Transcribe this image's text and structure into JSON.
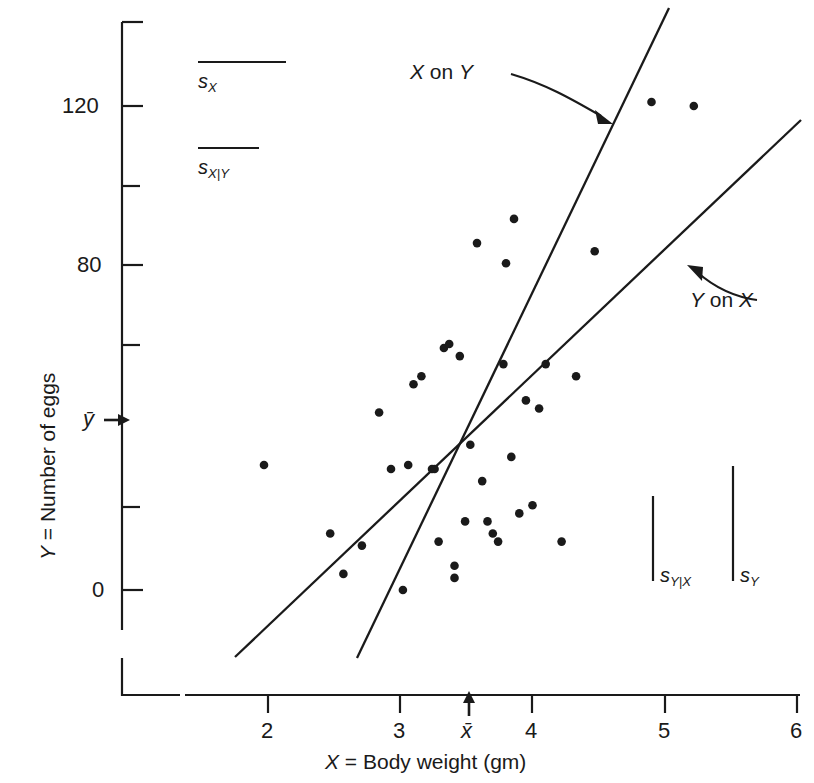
{
  "chart_data": {
    "type": "scatter",
    "title": "",
    "xlabel": "X = Body weight (gm)",
    "ylabel": "Y = Number of eggs",
    "xlim": [
      1.5,
      6.2
    ],
    "ylim": [
      -22,
      138
    ],
    "grid": false,
    "legend_position": "inside",
    "x_ticks": [
      "2",
      "3",
      "4",
      "5",
      "6"
    ],
    "x_tick_values": [
      2,
      3,
      4,
      5,
      6
    ],
    "y_ticks": [
      "0",
      "",
      "",
      "80",
      "",
      "120"
    ],
    "y_tick_values": [
      0,
      20,
      40,
      60,
      80,
      100,
      120
    ],
    "y_labeled_ticks": [
      {
        "value": 120,
        "label": "120"
      },
      {
        "value": 80,
        "label": "80"
      },
      {
        "value": 0,
        "label": "0"
      }
    ],
    "mean_markers": [
      {
        "name": "x-bar",
        "label": "x̄",
        "axis": "x",
        "value": 3.52
      },
      {
        "name": "y-bar",
        "label": "ȳ",
        "axis": "y",
        "value": 44
      }
    ],
    "points": [
      {
        "x": 1.97,
        "y": 31
      },
      {
        "x": 2.47,
        "y": 14
      },
      {
        "x": 2.57,
        "y": 4
      },
      {
        "x": 2.71,
        "y": 11
      },
      {
        "x": 2.84,
        "y": 44
      },
      {
        "x": 2.93,
        "y": 30
      },
      {
        "x": 3.02,
        "y": 0
      },
      {
        "x": 3.06,
        "y": 31
      },
      {
        "x": 3.1,
        "y": 51
      },
      {
        "x": 3.16,
        "y": 53
      },
      {
        "x": 3.24,
        "y": 30
      },
      {
        "x": 3.26,
        "y": 30
      },
      {
        "x": 3.29,
        "y": 12
      },
      {
        "x": 3.33,
        "y": 60
      },
      {
        "x": 3.37,
        "y": 61
      },
      {
        "x": 3.41,
        "y": 6
      },
      {
        "x": 3.41,
        "y": 3
      },
      {
        "x": 3.45,
        "y": 58
      },
      {
        "x": 3.49,
        "y": 17
      },
      {
        "x": 3.53,
        "y": 36
      },
      {
        "x": 3.58,
        "y": 86
      },
      {
        "x": 3.62,
        "y": 27
      },
      {
        "x": 3.66,
        "y": 17
      },
      {
        "x": 3.7,
        "y": 14
      },
      {
        "x": 3.74,
        "y": 12
      },
      {
        "x": 3.78,
        "y": 56
      },
      {
        "x": 3.8,
        "y": 81
      },
      {
        "x": 3.84,
        "y": 33
      },
      {
        "x": 3.86,
        "y": 92
      },
      {
        "x": 3.9,
        "y": 19
      },
      {
        "x": 3.95,
        "y": 47
      },
      {
        "x": 4.0,
        "y": 21
      },
      {
        "x": 4.05,
        "y": 45
      },
      {
        "x": 4.1,
        "y": 56
      },
      {
        "x": 4.22,
        "y": 12
      },
      {
        "x": 4.33,
        "y": 53
      },
      {
        "x": 4.47,
        "y": 84
      },
      {
        "x": 4.9,
        "y": 121
      },
      {
        "x": 5.22,
        "y": 120
      }
    ],
    "lines": [
      {
        "name": "Y on X",
        "label": "Y on X",
        "x_start": 1.88,
        "y_start": -20,
        "x_end": 6.03,
        "y_end": 116
      },
      {
        "name": "X on Y",
        "label": "X on Y",
        "x_start": 2.8,
        "y_start": -20,
        "x_end": 4.53,
        "y_end": 141
      }
    ],
    "annotations": [
      {
        "name": "x-on-y-annotation",
        "label": "X on Y",
        "target_line": "X on Y"
      },
      {
        "name": "y-on-x-annotation",
        "label": "Y on X",
        "target_line": "Y on X"
      }
    ],
    "scale_bars": [
      {
        "name": "s-x",
        "label": "s",
        "sub": "X",
        "orientation": "horizontal",
        "length_units": 0.9,
        "quantity": "standard deviation of X"
      },
      {
        "name": "s-x-given-y",
        "label": "s",
        "sub": "X|Y",
        "orientation": "horizontal",
        "length_units": 0.62,
        "quantity": "conditional standard deviation of X given Y"
      },
      {
        "name": "s-y-given-x",
        "label": "s",
        "sub": "Y|X",
        "orientation": "vertical",
        "length_units": 21,
        "quantity": "conditional standard deviation of Y given X"
      },
      {
        "name": "s-y",
        "label": "s",
        "sub": "Y",
        "orientation": "vertical",
        "length_units": 28,
        "quantity": "standard deviation of Y"
      }
    ]
  },
  "axes": {
    "x_title": "X = Body weight (gm)",
    "y_title": "Y = Number of eggs",
    "x_tick_labels": [
      "2",
      "3",
      "4",
      "5",
      "6"
    ],
    "y_tick_labels": [
      "0",
      "80",
      "120"
    ],
    "x_mean_label": "x̄",
    "y_mean_label": "ȳ"
  },
  "legend": {
    "sx": {
      "base": "s",
      "sub": "X"
    },
    "sxy": {
      "base": "s",
      "sub": "X|Y"
    },
    "syx": {
      "base": "s",
      "sub": "Y|X"
    },
    "sy": {
      "base": "s",
      "sub": "Y"
    }
  },
  "line_labels": {
    "x_on_y": "X on Y",
    "y_on_x": "Y on X"
  },
  "colors": {
    "ink": "#1a1a1a",
    "background": "#ffffff"
  }
}
